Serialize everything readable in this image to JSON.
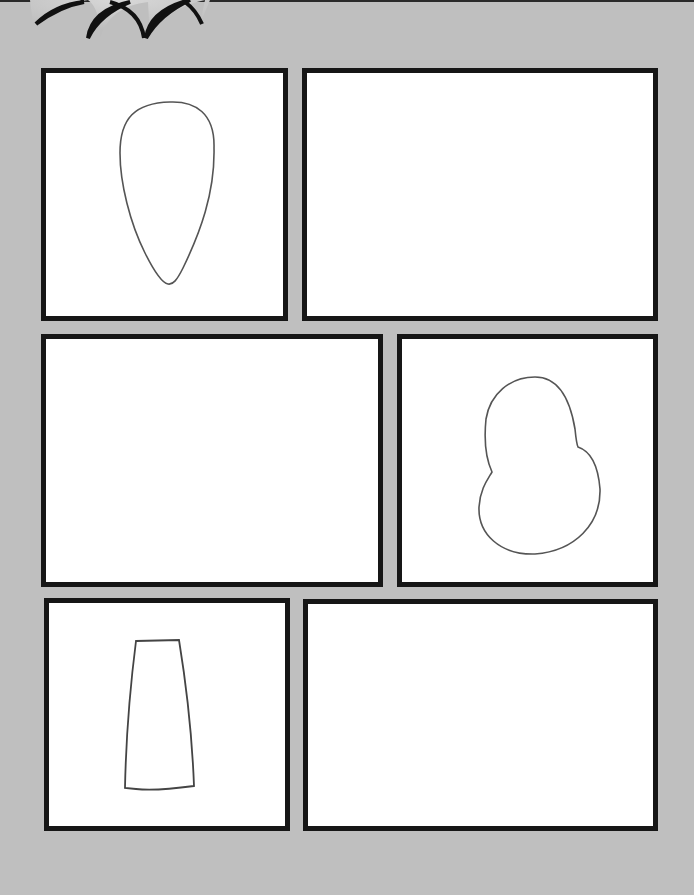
{
  "page": {
    "background_color": "#bfbfbf",
    "panel_border_color": "#161616",
    "panel_fill_color": "#ffffff",
    "sketch_stroke_color": "#555555"
  },
  "decoration": {
    "burst": "starburst-icon"
  },
  "panels": [
    {
      "id": "panel-1",
      "label": "Panel 1",
      "contains": "egg-shaped outline sketch"
    },
    {
      "id": "panel-2",
      "label": "Panel 2",
      "contains": "empty"
    },
    {
      "id": "panel-3",
      "label": "Panel 3",
      "contains": "empty"
    },
    {
      "id": "panel-4",
      "label": "Panel 4",
      "contains": "bean-shaped outline sketch"
    },
    {
      "id": "panel-5",
      "label": "Panel 5",
      "contains": "trapezoid outline sketch"
    },
    {
      "id": "panel-6",
      "label": "Panel 6",
      "contains": "empty"
    }
  ]
}
